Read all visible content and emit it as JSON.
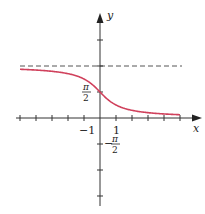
{
  "chart_data": {
    "type": "line",
    "title": "",
    "function": "y = arccot(x)",
    "xlabel": "x",
    "ylabel": "y",
    "x_tick_labels": [
      {
        "value": -1,
        "label": "−1"
      },
      {
        "value": 1,
        "label": "1"
      }
    ],
    "y_tick_labels": [
      {
        "value": 1.5708,
        "label_num": "π",
        "label_den": "2",
        "sign": ""
      },
      {
        "value": -1.5708,
        "label_num": "π",
        "label_den": "2",
        "sign": "−"
      }
    ],
    "xlim": [
      -5.5,
      6.2
    ],
    "ylim": [
      -5.6,
      6.6
    ],
    "x_ticks": [
      -5,
      -4,
      -3,
      -2,
      -1,
      1,
      2,
      3,
      4,
      5
    ],
    "y_ticks": [
      -4.712,
      -3.1416,
      -1.5708,
      1.5708,
      3.1416,
      4.712
    ],
    "asymptote": {
      "y": 3.1416,
      "style": "dashed"
    },
    "series": [
      {
        "name": "arccot(x)",
        "x_range": [
          -5,
          5
        ],
        "color": "#d0415c"
      }
    ],
    "grid": false,
    "legend": null
  },
  "colors": {
    "curve": "#d0415c",
    "axis": "#333333",
    "asymptote": "#555555"
  },
  "labels": {
    "x_axis": "x",
    "y_axis": "y",
    "minus_one": "−1",
    "one": "1",
    "pi": "π",
    "two": "2",
    "minus": "−"
  }
}
